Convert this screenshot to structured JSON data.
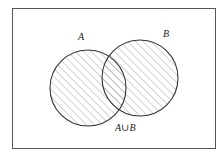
{
  "diagram": {
    "type": "venn",
    "title": "",
    "universe": {
      "x": 12,
      "y": 8,
      "width": 203,
      "height": 140,
      "stroke": "#444444"
    },
    "sets": [
      {
        "name": "A",
        "label": "A",
        "cx": 88,
        "cy": 88,
        "r": 38,
        "label_x": 78,
        "label_y": 40
      },
      {
        "name": "B",
        "label": "B",
        "cx": 140,
        "cy": 78,
        "r": 38,
        "label_x": 163,
        "label_y": 37
      }
    ],
    "shaded_region": "A∪B",
    "region_label": {
      "text": "A∪B",
      "x": 115,
      "y": 131
    },
    "colors": {
      "circle_stroke": "#333333",
      "hatch": "#9a9a9a",
      "frame": "#555555",
      "background": "#ffffff"
    }
  }
}
